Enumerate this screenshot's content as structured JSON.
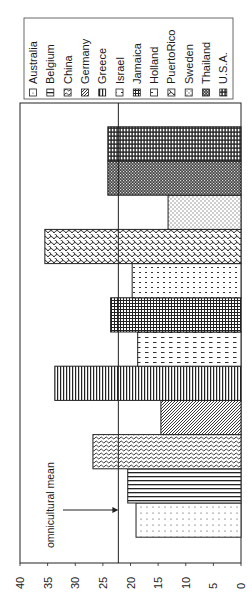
{
  "chart_data": {
    "type": "bar",
    "orientation": "rotated-90-ccw",
    "title": "",
    "xlabel": "",
    "ylabel": "",
    "ylim": [
      0,
      40
    ],
    "yticks": [
      0,
      5,
      10,
      15,
      20,
      25,
      30,
      35,
      40
    ],
    "ytick_labels": [
      "0",
      "5",
      "10",
      "15",
      "20",
      "25",
      "30",
      "35",
      "40"
    ],
    "grid": false,
    "legend_position": "top (rotated right)",
    "categories": [
      "Australia",
      "Belgium",
      "China",
      "Germany",
      "Greece",
      "Israel",
      "Jamaica",
      "Holland",
      "PuertoRico",
      "Sweden",
      "Thailand",
      "U.S.A."
    ],
    "values": [
      19.0,
      20.5,
      26.8,
      14.5,
      33.7,
      18.7,
      23.6,
      19.7,
      35.5,
      13.2,
      24.1,
      24.1
    ],
    "reference_line": {
      "label": "omnicultural mean",
      "value": 22.2
    },
    "annotations": [
      {
        "text": "omnicultural mean",
        "arrow_to": "reference_line"
      }
    ]
  },
  "legend": {
    "items": [
      {
        "label": "Australia",
        "pattern": "dots-sparse"
      },
      {
        "label": "Belgium",
        "pattern": "horizontal-lines"
      },
      {
        "label": "China",
        "pattern": "waves"
      },
      {
        "label": "Germany",
        "pattern": "diagonal"
      },
      {
        "label": "Greece",
        "pattern": "vertical-lines"
      },
      {
        "label": "Israel",
        "pattern": "dashes"
      },
      {
        "label": "Jamaica",
        "pattern": "grid"
      },
      {
        "label": "Holland",
        "pattern": "dots"
      },
      {
        "label": "PuertoRico",
        "pattern": "scales"
      },
      {
        "label": "Sweden",
        "pattern": "light-dots"
      },
      {
        "label": "Thailand",
        "pattern": "checker"
      },
      {
        "label": "U.S.A.",
        "pattern": "brick"
      }
    ]
  },
  "annotation": {
    "mean_label": "omnicultural  mean"
  },
  "colors": {
    "ink": "#1a1a1a",
    "background": "#ffffff"
  }
}
